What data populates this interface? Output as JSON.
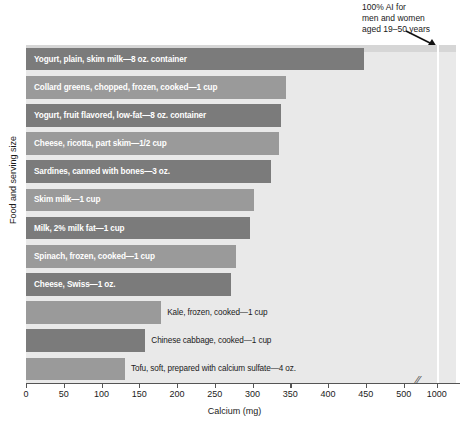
{
  "chart_data": {
    "type": "bar",
    "orientation": "horizontal",
    "title": "",
    "xlabel": "Calcium (mg)",
    "ylabel": "Food and serving size",
    "xticks": [
      0,
      50,
      100,
      150,
      200,
      250,
      300,
      350,
      400,
      450,
      500,
      1000
    ],
    "xtick_labels": [
      "0",
      "50",
      "100",
      "150",
      "200",
      "250",
      "300",
      "350",
      "400",
      "450",
      "500",
      "1000"
    ],
    "axis_break_after": 500,
    "xlim": [
      0,
      1000
    ],
    "grid": false,
    "legend": null,
    "categories": [
      "Yogurt, plain, skim milk—8 oz. container",
      "Collard greens, chopped, frozen, cooked—1 cup",
      "Yogurt, fruit flavored, low-fat—8 oz. container",
      "Cheese, ricotta, part skim—1/2 cup",
      "Sardines, canned with bones—3 oz.",
      "Skim milk—1 cup",
      "Milk, 2% milk fat—1 cup",
      "Spinach, frozen, cooked—1 cup",
      "Cheese, Swiss—1 oz.",
      "Kale, frozen, cooked—1 cup",
      "Chinese cabbage, cooked—1 cup",
      "Tofu, soft, prepared with calcium sulfate—4 oz."
    ],
    "values": [
      448,
      344,
      338,
      335,
      325,
      302,
      297,
      278,
      272,
      179,
      158,
      131
    ],
    "label_inside": [
      true,
      true,
      true,
      true,
      true,
      true,
      true,
      true,
      true,
      false,
      false,
      false
    ],
    "bar_colors": [
      "#7b7b7b",
      "#9a9a9a",
      "#7b7b7b",
      "#9a9a9a",
      "#7b7b7b",
      "#9a9a9a",
      "#7b7b7b",
      "#9a9a9a",
      "#7b7b7b",
      "#9a9a9a",
      "#7b7b7b",
      "#9a9a9a"
    ],
    "annotations": [
      {
        "text": "100% AI for\nmen and women\naged 19–50 years",
        "points_to_value": 1000
      }
    ],
    "reference_line": {
      "value": 1000,
      "color": "#ffffff"
    },
    "plot_background": "#e9e9e9"
  },
  "colors": {
    "bar_dark": "#7b7b7b",
    "bar_light": "#9a9a9a",
    "plot_bg": "#e9e9e9",
    "axis": "#555555",
    "text": "#1a1a1a",
    "inside_label": "#ffffff"
  }
}
